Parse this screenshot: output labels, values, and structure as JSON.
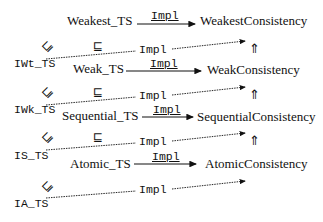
{
  "diagram": {
    "type": "refinement-diagram",
    "rows": [
      {
        "impl_spec": "Weakest_TS",
        "arrow_label": "Impl",
        "consistency": "WeakestConsistency"
      },
      {
        "impl_spec": "Weak_TS",
        "arrow_label": "Impl",
        "consistency": "WeakConsistency"
      },
      {
        "impl_spec": "Sequential_TS",
        "arrow_label": "Impl",
        "consistency": "SequentialConsistency"
      },
      {
        "impl_spec": "Atomic_TS",
        "arrow_label": "Impl",
        "consistency": "AtomicConsistency"
      }
    ],
    "intermediate": [
      {
        "label": "IWt_TS",
        "dashed_label": "Impl",
        "refines_symbol": "⊑",
        "mid_symbol": "⊑",
        "implies_symbol": "⇑"
      },
      {
        "label": "IWk_TS",
        "dashed_label": "Impl",
        "refines_symbol": "⊑",
        "mid_symbol": "⊑",
        "implies_symbol": "⇑"
      },
      {
        "label": "IS_TS",
        "dashed_label": "Impl",
        "refines_symbol": "⊑",
        "mid_symbol": "⊑",
        "implies_symbol": "⇑"
      },
      {
        "label": "IA_TS",
        "dashed_label": "Impl",
        "refines_symbol": "⊑"
      }
    ]
  }
}
